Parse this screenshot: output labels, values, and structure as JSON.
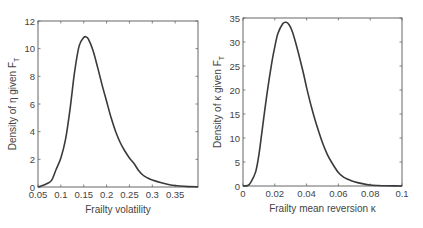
{
  "chart_data": [
    {
      "type": "line",
      "title": "",
      "xlabel": "Frailty volatility",
      "ylabel": "Density of η given F_T",
      "ylabel_main": "Density of η given F",
      "ylabel_sub": "T",
      "xlim": [
        0.05,
        0.4
      ],
      "ylim": [
        0,
        12
      ],
      "xticks": [
        0.05,
        0.1,
        0.15,
        0.2,
        0.25,
        0.3,
        0.35
      ],
      "xtick_labels": [
        "0.05",
        "0.1",
        "0.15",
        "0.2",
        "0.25",
        "0.3",
        "0.35"
      ],
      "yticks": [
        0,
        2,
        4,
        6,
        8,
        10,
        12
      ],
      "ytick_labels": [
        "0",
        "2",
        "4",
        "6",
        "8",
        "10",
        "12"
      ],
      "grid": false,
      "legend": null,
      "series": [
        {
          "name": "density",
          "x": [
            0.05,
            0.06,
            0.07,
            0.08,
            0.09,
            0.1,
            0.11,
            0.12,
            0.13,
            0.14,
            0.15,
            0.155,
            0.16,
            0.17,
            0.18,
            0.19,
            0.2,
            0.21,
            0.22,
            0.23,
            0.24,
            0.25,
            0.26,
            0.27,
            0.28,
            0.29,
            0.3,
            0.32,
            0.34,
            0.36,
            0.38,
            0.4
          ],
          "y": [
            0.0,
            0.1,
            0.25,
            0.5,
            1.3,
            2.1,
            3.4,
            5.6,
            8.3,
            10.2,
            10.8,
            10.85,
            10.7,
            9.9,
            8.7,
            7.4,
            6.2,
            5.0,
            4.0,
            3.2,
            2.6,
            2.1,
            1.7,
            1.2,
            0.85,
            0.65,
            0.5,
            0.3,
            0.15,
            0.07,
            0.03,
            0.02
          ]
        }
      ],
      "plot_box": {
        "left": 38,
        "top": 21,
        "right": 198,
        "bottom": 187
      }
    },
    {
      "type": "line",
      "title": "",
      "xlabel": "Frailty mean reversion κ",
      "ylabel": "Density of κ given F_T",
      "ylabel_main": "Density of κ given F",
      "ylabel_sub": "T",
      "xlim": [
        0,
        0.1
      ],
      "ylim": [
        0,
        35
      ],
      "xticks": [
        0,
        0.02,
        0.04,
        0.06,
        0.08,
        0.1
      ],
      "xtick_labels": [
        "0",
        "0.02",
        "0.04",
        "0.06",
        "0.08",
        "0.1"
      ],
      "yticks": [
        0,
        5,
        10,
        15,
        20,
        25,
        30,
        35
      ],
      "ytick_labels": [
        "0",
        "5",
        "10",
        "15",
        "20",
        "25",
        "30",
        "35"
      ],
      "grid": false,
      "legend": null,
      "series": [
        {
          "name": "density",
          "x": [
            0.0,
            0.003,
            0.005,
            0.008,
            0.01,
            0.012,
            0.015,
            0.018,
            0.02,
            0.022,
            0.025,
            0.027,
            0.029,
            0.031,
            0.033,
            0.035,
            0.038,
            0.04,
            0.043,
            0.046,
            0.05,
            0.053,
            0.056,
            0.06,
            0.063,
            0.066,
            0.07,
            0.075,
            0.08,
            0.085,
            0.09,
            0.1
          ],
          "y": [
            0.0,
            0.1,
            0.8,
            3.0,
            6.5,
            11.5,
            19.0,
            25.5,
            29.0,
            31.8,
            33.8,
            34.1,
            33.6,
            32.2,
            30.0,
            27.5,
            23.5,
            20.5,
            16.5,
            13.0,
            9.0,
            6.6,
            4.8,
            2.8,
            1.9,
            1.4,
            0.9,
            0.5,
            0.2,
            0.1,
            0.05,
            0.0
          ]
        }
      ],
      "plot_box": {
        "left": 243,
        "top": 18,
        "right": 402,
        "bottom": 186
      }
    }
  ]
}
